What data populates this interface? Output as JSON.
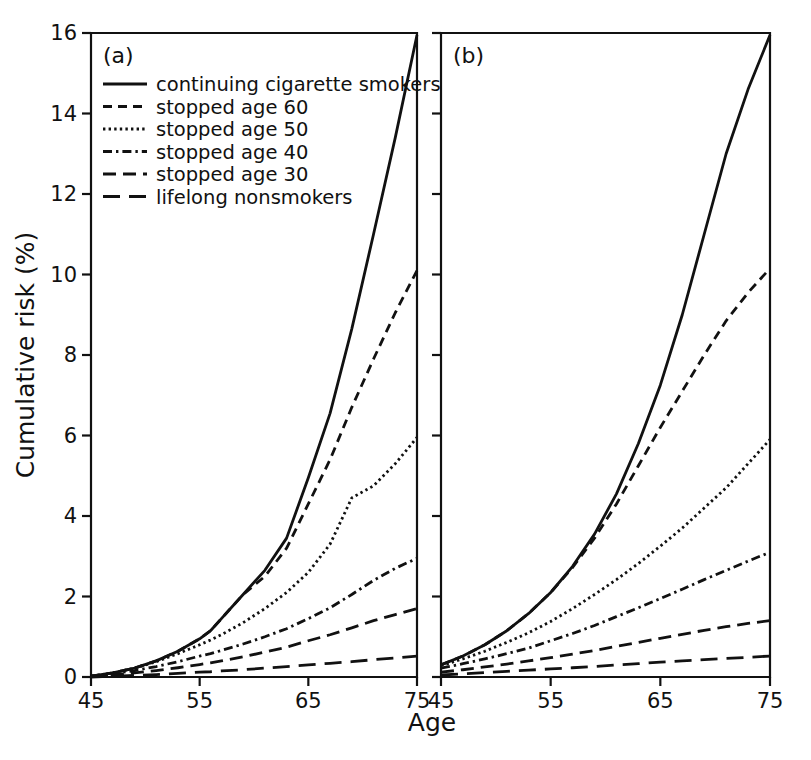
{
  "figure": {
    "background": "#ffffff",
    "ink_color": "#111111",
    "width": 811,
    "height": 760
  },
  "axis": {
    "xlabel": "Age",
    "ylabel": "Cumulative risk (%)",
    "xticks": [
      "45",
      "55",
      "65",
      "75"
    ],
    "xtick_values": [
      45,
      55,
      65,
      75
    ],
    "yticks": [
      "0",
      "2",
      "4",
      "6",
      "8",
      "10",
      "12",
      "14",
      "16"
    ],
    "ytick_values": [
      0,
      2,
      4,
      6,
      8,
      10,
      12,
      14,
      16
    ],
    "xlim": [
      45,
      75
    ],
    "ylim": [
      0,
      16
    ],
    "grid": false
  },
  "panels": [
    {
      "key": "a",
      "label": "(a)"
    },
    {
      "key": "b",
      "label": "(b)"
    }
  ],
  "legend": {
    "position": "top-left-panel-a",
    "items": [
      {
        "label": "continuing cigarette smokers",
        "style": "solid",
        "dasharray": "none",
        "width": 2.8
      },
      {
        "label": "stopped age 60",
        "style": "dashed",
        "dasharray": "9,6",
        "width": 2.8
      },
      {
        "label": "stopped age 50",
        "style": "dotted",
        "dasharray": "2.4,3.2",
        "width": 2.8
      },
      {
        "label": "stopped age 40",
        "style": "dash-dot",
        "dasharray": "9,4,2.4,4",
        "width": 2.8
      },
      {
        "label": "stopped age 30",
        "style": "long-dash",
        "dasharray": "13,7",
        "width": 2.8
      },
      {
        "label": "lifelong nonsmokers",
        "style": "long-dash-2",
        "dasharray": "17,9",
        "width": 2.8
      }
    ]
  },
  "chart_data": {
    "type": "line",
    "title": "",
    "subtitle": "",
    "xlabel": "Age",
    "ylabel": "Cumulative risk (%)",
    "xlim": [
      45,
      75
    ],
    "ylim": [
      0,
      16
    ],
    "xticks": [
      45,
      55,
      65,
      75
    ],
    "yticks": [
      0,
      2,
      4,
      6,
      8,
      10,
      12,
      14,
      16
    ],
    "grid": false,
    "legend_position": "upper-left of panel (a)",
    "panels": [
      {
        "key": "a",
        "label": "(a)",
        "x": [
          45,
          47,
          49,
          51,
          53,
          55,
          56,
          57,
          59,
          61,
          63,
          65,
          67,
          69,
          71,
          73,
          75
        ],
        "series": [
          {
            "name": "continuing cigarette smokers",
            "style": "solid",
            "values": [
              0.02,
              0.1,
              0.22,
              0.4,
              0.64,
              0.95,
              1.15,
              1.45,
              2.05,
              2.65,
              3.45,
              4.95,
              6.55,
              8.65,
              11.0,
              13.4,
              15.95
            ]
          },
          {
            "name": "stopped age 60",
            "style": "dashed",
            "values": [
              0.02,
              0.1,
              0.22,
              0.4,
              0.64,
              0.95,
              1.15,
              1.45,
              2.05,
              2.5,
              3.2,
              4.3,
              5.4,
              6.7,
              7.9,
              9.05,
              10.1
            ]
          },
          {
            "name": "stopped age 50",
            "style": "dotted",
            "values": [
              0.02,
              0.1,
              0.22,
              0.38,
              0.58,
              0.8,
              0.92,
              1.05,
              1.35,
              1.7,
              2.1,
              2.6,
              3.3,
              4.45,
              4.75,
              5.3,
              5.95
            ]
          },
          {
            "name": "stopped age 40",
            "style": "dash-dot",
            "values": [
              0.02,
              0.08,
              0.16,
              0.26,
              0.38,
              0.52,
              0.58,
              0.66,
              0.82,
              1.0,
              1.2,
              1.45,
              1.72,
              2.05,
              2.4,
              2.7,
              2.95
            ]
          },
          {
            "name": "stopped age 30",
            "style": "long-dash",
            "values": [
              0.01,
              0.05,
              0.1,
              0.16,
              0.23,
              0.31,
              0.35,
              0.4,
              0.5,
              0.62,
              0.74,
              0.9,
              1.05,
              1.22,
              1.4,
              1.55,
              1.7
            ]
          },
          {
            "name": "lifelong nonsmokers",
            "style": "long-dash-2",
            "values": [
              0.0,
              0.02,
              0.04,
              0.06,
              0.09,
              0.12,
              0.13,
              0.15,
              0.18,
              0.22,
              0.26,
              0.3,
              0.34,
              0.38,
              0.43,
              0.47,
              0.52
            ]
          }
        ]
      },
      {
        "key": "b",
        "label": "(b)",
        "x": [
          45,
          47,
          49,
          51,
          53,
          55,
          57,
          59,
          61,
          63,
          65,
          67,
          69,
          71,
          73,
          75
        ],
        "series": [
          {
            "name": "continuing cigarette smokers",
            "style": "solid",
            "values": [
              0.3,
              0.52,
              0.8,
              1.15,
              1.58,
              2.1,
              2.75,
              3.55,
              4.55,
              5.8,
              7.25,
              9.0,
              11.0,
              13.0,
              14.6,
              15.95
            ]
          },
          {
            "name": "stopped age 60",
            "style": "dashed",
            "values": [
              0.3,
              0.52,
              0.8,
              1.15,
              1.58,
              2.1,
              2.72,
              3.45,
              4.3,
              5.25,
              6.2,
              7.1,
              8.0,
              8.85,
              9.55,
              10.15
            ]
          },
          {
            "name": "stopped age 50",
            "style": "dotted",
            "values": [
              0.28,
              0.45,
              0.64,
              0.86,
              1.1,
              1.38,
              1.7,
              2.05,
              2.42,
              2.82,
              3.25,
              3.7,
              4.2,
              4.7,
              5.3,
              5.9
            ]
          },
          {
            "name": "stopped age 40",
            "style": "dash-dot",
            "values": [
              0.22,
              0.33,
              0.45,
              0.58,
              0.72,
              0.9,
              1.08,
              1.28,
              1.5,
              1.72,
              1.95,
              2.18,
              2.42,
              2.65,
              2.88,
              3.1
            ]
          },
          {
            "name": "stopped age 30",
            "style": "long-dash",
            "values": [
              0.12,
              0.18,
              0.25,
              0.32,
              0.4,
              0.48,
              0.57,
              0.66,
              0.76,
              0.86,
              0.96,
              1.06,
              1.16,
              1.25,
              1.33,
              1.4
            ]
          },
          {
            "name": "lifelong nonsmokers",
            "style": "long-dash-2",
            "values": [
              0.05,
              0.08,
              0.11,
              0.14,
              0.17,
              0.2,
              0.23,
              0.26,
              0.3,
              0.33,
              0.37,
              0.4,
              0.43,
              0.46,
              0.49,
              0.52
            ]
          }
        ]
      }
    ]
  }
}
